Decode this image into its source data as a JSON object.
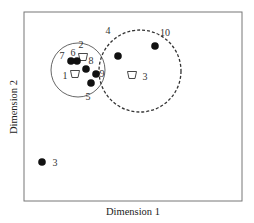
{
  "chart_data": {
    "type": "scatter",
    "title": "",
    "xlabel": "Dimension 1",
    "ylabel": "Dimension 2",
    "grid": false,
    "legend": "none",
    "plot_box": {
      "left": 24,
      "top": 12,
      "right": 242,
      "bottom": 201
    },
    "points": [
      {
        "label": "7",
        "x": 71,
        "y": 61,
        "marker": "filled-circle",
        "label_dx": -9,
        "label_dy": -2
      },
      {
        "label": "6",
        "x": 77,
        "y": 61,
        "marker": "filled-circle",
        "label_dx": -4,
        "label_dy": -5
      },
      {
        "label": "8",
        "x": 86,
        "y": 69,
        "marker": "filled-circle",
        "label_dx": 5,
        "label_dy": -5
      },
      {
        "label": "9",
        "x": 96,
        "y": 74,
        "marker": "filled-circle",
        "label_dx": 6,
        "label_dy": 3
      },
      {
        "label": "5",
        "x": 91,
        "y": 83,
        "marker": "filled-circle",
        "label_dx": -3,
        "label_dy": 17
      },
      {
        "label": "4",
        "x": 118,
        "y": 56,
        "marker": "filled-circle",
        "label_dx": -10,
        "label_dy": -22
      },
      {
        "label": "10",
        "x": 155,
        "y": 46,
        "marker": "filled-circle",
        "label_dx": 10,
        "label_dy": -10
      },
      {
        "label": "3",
        "x": 42,
        "y": 162,
        "marker": "filled-circle",
        "label_dx": 13,
        "label_dy": 4
      }
    ],
    "centroids": [
      {
        "label": "2",
        "x": 83,
        "y": 57,
        "marker": "trapezoid",
        "label_dx": -2,
        "label_dy": -9
      },
      {
        "label": "1",
        "x": 75,
        "y": 74,
        "marker": "trapezoid",
        "label_dx": -10,
        "label_dy": 5
      },
      {
        "label": "3",
        "x": 132,
        "y": 75,
        "marker": "trapezoid",
        "label_dx": 13,
        "label_dy": 5
      }
    ],
    "clusters": [
      {
        "name": "solid-cluster",
        "cx": 78,
        "cy": 70,
        "r": 27,
        "style": "solid"
      },
      {
        "name": "dashed-cluster",
        "cx": 140,
        "cy": 71,
        "r": 41,
        "style": "dashed"
      }
    ]
  }
}
